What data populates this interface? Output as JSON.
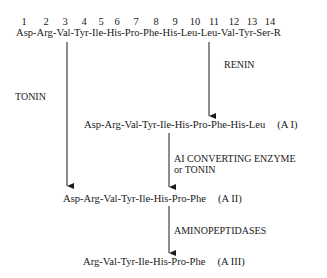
{
  "diagram": {
    "positions": [
      "1",
      "2",
      "3",
      "4",
      "5",
      "6",
      "7",
      "8",
      "9",
      "10",
      "11",
      "12",
      "13",
      "14"
    ],
    "position_x": [
      18,
      40,
      59,
      79,
      98,
      117,
      136,
      156,
      175,
      194,
      213,
      233,
      252,
      270
    ],
    "substrate": "Asp-Arg-Val-Tyr-Ile-His-Pro-Phe-His-Leu-Leu-Val-Tyr-Ser-R",
    "enzymes": {
      "renin": "RENIN",
      "tonin": "TONIN",
      "converting": "AI CONVERTING ENZYME",
      "converting_alt": "or TONIN",
      "aminopeptidases": "AMINOPEPTIDASES"
    },
    "products": {
      "a1": {
        "sequence": "Asp-Arg-Val-Tyr-Ile-His-Pro-Phe-His-Leu",
        "tag": "(A I)"
      },
      "a2": {
        "sequence": "Asp-Arg-Val-Tyr-Ile-His-Pro-Phe",
        "tag": "(A II)"
      },
      "a3": {
        "sequence": "Arg-Val-Tyr-Ile-His-Pro-Phe",
        "tag": "(A III)"
      }
    },
    "line_color": "#1a1a1a"
  }
}
